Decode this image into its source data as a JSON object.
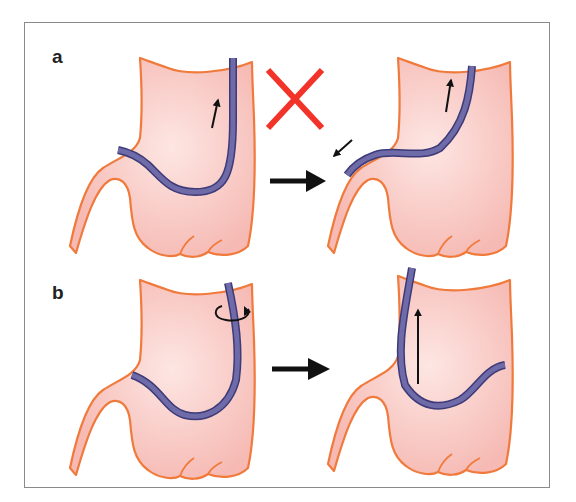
{
  "figure": {
    "panels": [
      {
        "label": "a",
        "steps": [
          {
            "description": "stomach with endoscope in J-shaped retroflexion, arrow pointing up (withdrawal)",
            "marker": "red-x-icon"
          },
          {
            "description": "endoscope slipping back into esophagus, arrow pointing toward esophagus"
          }
        ],
        "transition": "right-arrow"
      },
      {
        "label": "b",
        "steps": [
          {
            "description": "stomach with endoscope in retroflexion, rotation arrow at shaft"
          },
          {
            "description": "endoscope straightened, arrow pointing up along shaft"
          }
        ],
        "transition": "right-arrow"
      }
    ]
  },
  "colors": {
    "stomach_fill": "#f9c9c5",
    "stomach_outline": "#f07a3c",
    "endoscope": "#6f6aa8",
    "endoscope_edge": "#3d3a78",
    "red_x": "#f2332a",
    "arrow": "#111111",
    "frame": "#8a8a8a"
  }
}
